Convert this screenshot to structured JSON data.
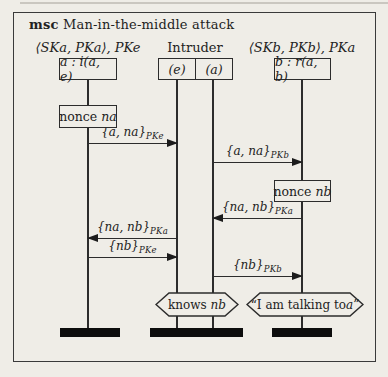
{
  "title": {
    "keyword": "msc",
    "text": " Man-in-the-middle attack"
  },
  "instances": {
    "a": {
      "header": "⟨SKa, PKa⟩, PKe",
      "box": "a : i(a, e)"
    },
    "intruder": {
      "header": "Intruder",
      "box_left": "(e)",
      "box_right": "(a)"
    },
    "b": {
      "header": "⟨SKb, PKb⟩, PKa",
      "box": "b : r(a, b)"
    }
  },
  "actions": {
    "nonce_na": {
      "label": "nonce",
      "var": "na"
    },
    "nonce_nb": {
      "label": "nonce",
      "var": "nb"
    }
  },
  "messages": [
    {
      "text": "{a, na}",
      "sub": "PKe",
      "from": "a",
      "to": "intruder-e",
      "direction": "right"
    },
    {
      "text": "{a, na}",
      "sub": "PKb",
      "from": "intruder-a",
      "to": "b",
      "direction": "right"
    },
    {
      "text": "{na, nb}",
      "sub": "PKa",
      "from": "b",
      "to": "intruder-a",
      "direction": "left"
    },
    {
      "text": "{na, nb}",
      "sub": "PKa",
      "from": "intruder-e",
      "to": "a",
      "direction": "left"
    },
    {
      "text": "{nb}",
      "sub": "PKe",
      "from": "a",
      "to": "intruder-e",
      "direction": "right"
    },
    {
      "text": "{nb}",
      "sub": "PKb",
      "from": "intruder-a",
      "to": "b",
      "direction": "right"
    }
  ],
  "conditions": {
    "knows_nb": {
      "label": "knows",
      "var": "nb"
    },
    "talking": {
      "prefix": "“I am talking to ",
      "var": "a",
      "suffix": "”"
    }
  },
  "colors": {
    "paper": "#efede7",
    "ink": "#2c2c2c",
    "bar": "#0d0d0d"
  }
}
